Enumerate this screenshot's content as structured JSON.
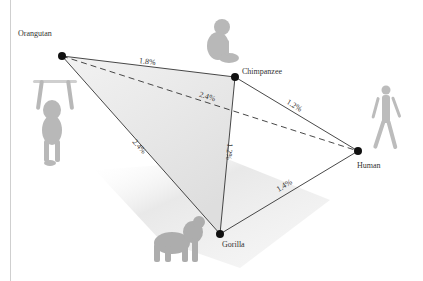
{
  "diagram": {
    "title": "",
    "colors": {
      "edge": "#333333",
      "node": "#111111",
      "triangle_fill": "#e9e9e9",
      "shadow": "#ececec",
      "label": "#333333",
      "animal": "#b5b5b5"
    },
    "nodes": [
      {
        "id": "orangutan",
        "label": "Orangutan",
        "x": 62,
        "y": 56,
        "icon": "orangutan-hanging-icon"
      },
      {
        "id": "chimpanzee",
        "label": "Chimpanzee",
        "x": 235,
        "y": 77,
        "icon": "chimpanzee-sitting-icon"
      },
      {
        "id": "human",
        "label": "Human",
        "x": 358,
        "y": 151,
        "icon": "human-walking-icon"
      },
      {
        "id": "gorilla",
        "label": "Gorilla",
        "x": 220,
        "y": 234,
        "icon": "gorilla-walking-icon"
      }
    ],
    "edges": [
      {
        "from": "orangutan",
        "to": "chimpanzee",
        "label": "1.8%",
        "style": "solid"
      },
      {
        "from": "orangutan",
        "to": "human",
        "label": "2.4%",
        "style": "dashed"
      },
      {
        "from": "orangutan",
        "to": "gorilla",
        "label": "2.4%",
        "style": "solid"
      },
      {
        "from": "chimpanzee",
        "to": "human",
        "label": "1.2%",
        "style": "solid"
      },
      {
        "from": "chimpanzee",
        "to": "gorilla",
        "label": "1.2%",
        "style": "solid"
      },
      {
        "from": "gorilla",
        "to": "human",
        "label": "1.4%",
        "style": "solid"
      }
    ]
  }
}
